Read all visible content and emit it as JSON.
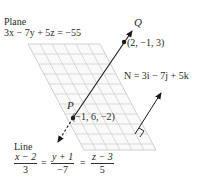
{
  "plane": {
    "title": "Plane",
    "equation": "3x − 7y + 5z = −55"
  },
  "points": {
    "Q": {
      "label": "Q",
      "coords": "(2, −1, 3)"
    },
    "P": {
      "label": "P",
      "coords": "(−1, 6, −2)"
    }
  },
  "normal": {
    "label": "N = 3i − 7j + 5k"
  },
  "line": {
    "title": "Line",
    "fractions": [
      {
        "num": "x − 2",
        "den": "3"
      },
      {
        "num": "y + 1",
        "den": "−7"
      },
      {
        "num": "z − 3",
        "den": "5"
      }
    ],
    "eq_sign": "="
  },
  "colors": {
    "grid": "#c8c8c8",
    "line": "#1a1a1a",
    "text": "#2a2a2a"
  }
}
